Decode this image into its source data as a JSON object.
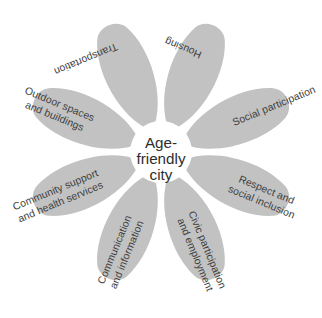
{
  "diagram": {
    "type": "flower-petal-diagram",
    "core": {
      "label_lines": [
        "Age-",
        "friendly",
        "city"
      ],
      "full_label": "Age-friendly city",
      "fill_color": "#ffffff",
      "text_color": "#2e2e2e"
    },
    "style": {
      "petal_color": "#c2c2c2",
      "background_color": "#ffffff",
      "petal_text_color": "#3d3d3d"
    },
    "petal_count": 8,
    "petals": [
      {
        "id": "transportation",
        "label_lines": [
          "Transportation"
        ],
        "full_label": "Transportation",
        "position": "top-left"
      },
      {
        "id": "housing",
        "label_lines": [
          "Housing"
        ],
        "full_label": "Housing",
        "position": "top-right"
      },
      {
        "id": "social-participation",
        "label_lines": [
          "Social participation"
        ],
        "full_label": "Social participation",
        "position": "right-upper"
      },
      {
        "id": "respect-and-social-inclusion",
        "label_lines": [
          "Respect and",
          "social inclusion"
        ],
        "full_label": "Respect and social inclusion",
        "position": "right-lower"
      },
      {
        "id": "civic-participation-and-employment",
        "label_lines": [
          "Civic participation",
          "and employment"
        ],
        "full_label": "Civic participation and employment",
        "position": "bottom-right"
      },
      {
        "id": "communication-and-information",
        "label_lines": [
          "Communication",
          "and information"
        ],
        "full_label": "Communication and information",
        "position": "bottom-left"
      },
      {
        "id": "community-support-and-health-services",
        "label_lines": [
          "Community support",
          "and health services"
        ],
        "full_label": "Community support and health services",
        "position": "left-lower"
      },
      {
        "id": "outdoor-spaces-and-buildings",
        "label_lines": [
          "Outdoor spaces",
          "and buildings"
        ],
        "full_label": "Outdoor spaces and buildings",
        "position": "left-upper"
      }
    ]
  }
}
